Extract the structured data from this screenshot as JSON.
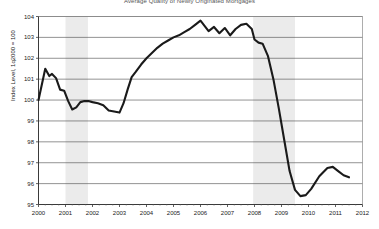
{
  "chart_data": {
    "type": "line",
    "title": "Average Quality of Newly Originated Mortgages",
    "xlabel": "",
    "ylabel": "Index Level, 1q2000 = 100",
    "xlim": [
      2000,
      2012
    ],
    "ylim": [
      95,
      104
    ],
    "ytick_labels": [
      "95",
      "96",
      "97",
      "98",
      "99",
      "100",
      "101",
      "102",
      "103",
      "104"
    ],
    "yticks": [
      95,
      96,
      97,
      98,
      99,
      100,
      101,
      102,
      103,
      104
    ],
    "xtick_labels": [
      "2000",
      "2001",
      "2002",
      "2003",
      "2004",
      "2005",
      "2006",
      "2007",
      "2008",
      "2009",
      "2010",
      "2011",
      "2012"
    ],
    "xticks": [
      2000,
      2001,
      2002,
      2003,
      2004,
      2005,
      2006,
      2007,
      2008,
      2009,
      2010,
      2011,
      2012
    ],
    "grid": true,
    "grid_axis": "y",
    "legend": false,
    "line_color": "#1a1a1a",
    "line_width": 2.1,
    "shaded_band_color": "#ebebeb",
    "shaded_bands": [
      {
        "label": "recession-2001",
        "start": 2001.0,
        "end": 2001.83
      },
      {
        "label": "recession-2008",
        "start": 2007.95,
        "end": 2009.5
      }
    ],
    "series": [
      {
        "name": "Mortgage Quality Index",
        "x": [
          2000.0,
          2000.25,
          2000.4,
          2000.5,
          2000.65,
          2000.8,
          2000.95,
          2001.1,
          2001.25,
          2001.4,
          2001.55,
          2001.7,
          2001.85,
          2002.0,
          2002.2,
          2002.4,
          2002.6,
          2002.8,
          2003.0,
          2003.15,
          2003.3,
          2003.45,
          2003.6,
          2003.8,
          2004.0,
          2004.2,
          2004.4,
          2004.6,
          2004.8,
          2005.0,
          2005.2,
          2005.4,
          2005.6,
          2005.8,
          2006.0,
          2006.15,
          2006.3,
          2006.5,
          2006.7,
          2006.9,
          2007.1,
          2007.3,
          2007.5,
          2007.7,
          2007.9,
          2008.0,
          2008.15,
          2008.3,
          2008.5,
          2008.7,
          2008.9,
          2009.1,
          2009.3,
          2009.5,
          2009.7,
          2009.9,
          2010.1,
          2010.4,
          2010.7,
          2010.9,
          2011.1,
          2011.3,
          2011.5
        ],
        "y": [
          100.0,
          101.5,
          101.15,
          101.25,
          101.05,
          100.5,
          100.45,
          99.95,
          99.55,
          99.65,
          99.9,
          99.95,
          99.95,
          99.9,
          99.85,
          99.75,
          99.5,
          99.45,
          99.4,
          99.85,
          100.5,
          101.1,
          101.35,
          101.7,
          102.0,
          102.25,
          102.5,
          102.7,
          102.85,
          103.0,
          103.1,
          103.25,
          103.4,
          103.6,
          103.8,
          103.55,
          103.3,
          103.5,
          103.2,
          103.45,
          103.1,
          103.4,
          103.6,
          103.65,
          103.4,
          102.9,
          102.75,
          102.7,
          102.1,
          101.0,
          99.6,
          98.1,
          96.6,
          95.7,
          95.4,
          95.45,
          95.75,
          96.35,
          96.75,
          96.8,
          96.6,
          96.4,
          96.3
        ]
      }
    ]
  }
}
